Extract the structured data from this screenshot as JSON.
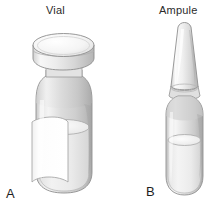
{
  "figure": {
    "background_color": "#ffffff",
    "width": 223,
    "height": 208
  },
  "items": [
    {
      "key": "vial",
      "title": "Vial",
      "panel_letter": "A",
      "icon_name": "medication-vial-illustration",
      "parts": [
        "metal cap",
        "glass body",
        "paper label",
        "liquid medication"
      ],
      "colors": {
        "glass_light": "#f2f2f2",
        "glass_mid": "#d8d8d8",
        "glass_dark": "#b9b9b9",
        "cap_light": "#fbfbfb",
        "cap_shadow": "#c8c8c8",
        "liquid": "#ededed",
        "label_paper": "#ffffff",
        "outline": "#8d8d8d"
      }
    },
    {
      "key": "ampule",
      "title": "Ampule",
      "panel_letter": "B",
      "icon_name": "glass-ampule-illustration",
      "parts": [
        "tapered neck tip",
        "constriction score",
        "glass body",
        "liquid medication"
      ],
      "colors": {
        "glass_light": "#f4f4f4",
        "glass_mid": "#dcdcdc",
        "glass_dark": "#bdbdbd",
        "liquid": "#ececec",
        "outline": "#8d8d8d"
      }
    }
  ]
}
